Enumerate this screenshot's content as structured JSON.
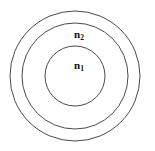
{
  "diagram": {
    "background_color": "#ffffff",
    "stroke_color": "#4a4a4a",
    "label_color": "#111111",
    "circles": [
      {
        "name": "outer-circle",
        "cx": 75,
        "cy": 76,
        "r": 65
      },
      {
        "name": "middle-circle",
        "cx": 75,
        "cy": 76,
        "r": 53
      },
      {
        "name": "inner-circle",
        "cx": 75,
        "cy": 76,
        "r": 30
      }
    ],
    "labels": [
      {
        "name": "label-n2",
        "base": "n",
        "subscript": "2",
        "x": 79,
        "y": 35
      },
      {
        "name": "label-n1",
        "base": "n",
        "subscript": "1",
        "x": 79,
        "y": 66
      }
    ]
  }
}
